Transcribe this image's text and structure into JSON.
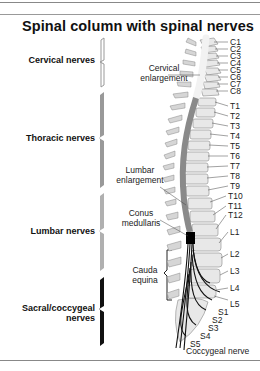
{
  "title": "Spinal column with spinal nerves",
  "nerve_groups": [
    {
      "label": "Cervical nerves",
      "color": "#ffffff"
    },
    {
      "label": "Thoracic nerves",
      "color": "#9a9a9a"
    },
    {
      "label": "Lumbar nerves",
      "color": "#b5b5b5"
    },
    {
      "label": "Sacral/coccygeal nerves",
      "label_line1": "Sacral/coccygeal",
      "label_line2": "nerves",
      "color": "#111111"
    }
  ],
  "regions": {
    "cervical_enlargement": {
      "line1": "Cervical",
      "line2": "enlargement"
    },
    "lumbar_enlargement": {
      "line1": "Lumbar",
      "line2": "enlargement"
    },
    "conus_medullaris": {
      "line1": "Conus",
      "line2": "medullaris"
    },
    "cauda_equina": {
      "line1": "Cauda",
      "line2": "equina"
    }
  },
  "vertebra_labels": [
    "C1",
    "C2",
    "C3",
    "C4",
    "C5",
    "C6",
    "C7",
    "C8",
    "T1",
    "T2",
    "T3",
    "T4",
    "T5",
    "T6",
    "T7",
    "T8",
    "T9",
    "T10",
    "T11",
    "T12",
    "L1",
    "L2",
    "L3",
    "L4",
    "L5",
    "S1",
    "S2",
    "S3",
    "S4",
    "S5",
    "Coccygeal nerve"
  ]
}
